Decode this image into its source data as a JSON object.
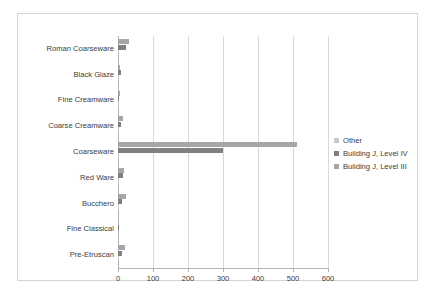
{
  "chart_data": {
    "type": "bar",
    "orientation": "horizontal",
    "title": "",
    "xlabel": "",
    "ylabel": "",
    "xlim": [
      0,
      600
    ],
    "xticks": [
      0,
      100,
      200,
      300,
      400,
      500,
      600
    ],
    "xtick_labels": [
      "0",
      "100",
      "200",
      "300",
      "400",
      "500",
      "600"
    ],
    "grid": true,
    "legend_position": "right",
    "categories": [
      "Roman Coarseware",
      "Black Glaze",
      "Fine Creamware",
      "Coarse Creamware",
      "Coarseware",
      "Red Ware",
      "Bucchero",
      "Fine Classical",
      "Pre-Etruscan"
    ],
    "series": [
      {
        "name": "Building J, Level III",
        "color": "#a6a6a6",
        "values": [
          30,
          7,
          5,
          14,
          510,
          16,
          22,
          0,
          20
        ]
      },
      {
        "name": "Building J, Level IV",
        "color": "#808080",
        "values": [
          22,
          9,
          4,
          8,
          300,
          13,
          11,
          2,
          11
        ]
      },
      {
        "name": "Other",
        "color": "#c9c9c9",
        "values": [
          2,
          1,
          1,
          1,
          4,
          1,
          2,
          0,
          1
        ]
      }
    ]
  },
  "legend": {
    "items": [
      {
        "label": "Other",
        "color": "#c9c9c9"
      },
      {
        "label": "Building J, Level IV",
        "color": "#808080"
      },
      {
        "label": "Building J, Level III",
        "color": "#a6a6a6"
      }
    ]
  },
  "colors": {
    "frame_border": "#d4d4d4",
    "gridline": "#d9d9d9",
    "axis": "#b0b0b0",
    "text": "#3a3a3a",
    "background": "#ffffff"
  }
}
